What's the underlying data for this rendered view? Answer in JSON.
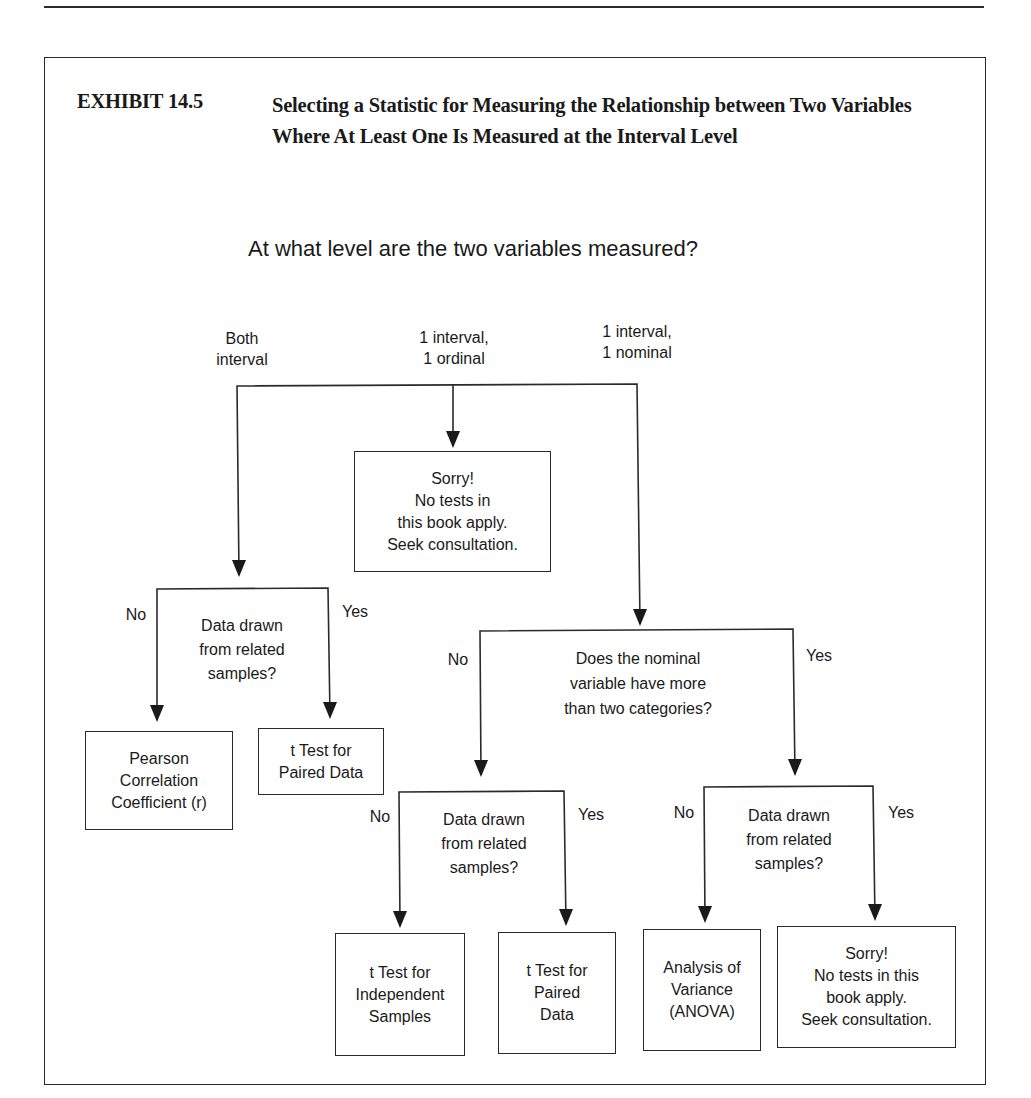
{
  "exhibit": {
    "label": "EXHIBIT 14.5",
    "title": "Selecting a Statistic for Measuring the Relationship between Two Variables Where At Least One Is Measured at the Interval Level"
  },
  "flowchart": {
    "root_question": "At what level are the two variables measured?",
    "level_options": [
      {
        "label": "Both\ninterval"
      },
      {
        "label": "1 interval,\n1 ordinal"
      },
      {
        "label": "1 interval,\n1 nominal"
      }
    ],
    "ordinal_result": "Sorry!\nNo tests in\nthis book apply.\nSeek consultation.",
    "both_interval": {
      "question": "Data drawn\nfrom related\nsamples?",
      "no_label": "No",
      "yes_label": "Yes",
      "no_result": "Pearson\nCorrelation\nCoefficient (r)",
      "yes_result": "t Test for\nPaired Data"
    },
    "nominal": {
      "question": "Does the nominal\nvariable have more\nthan two categories?",
      "no_label": "No",
      "yes_label": "Yes",
      "two_categories": {
        "question": "Data drawn\nfrom related\nsamples?",
        "no_label": "No",
        "yes_label": "Yes",
        "no_result": "t Test for\nIndependent\nSamples",
        "yes_result": "t Test for\nPaired\nData"
      },
      "more_categories": {
        "question": "Data drawn\nfrom related\nsamples?",
        "no_label": "No",
        "yes_label": "Yes",
        "no_result": "Analysis of\nVariance\n(ANOVA)",
        "yes_result": "Sorry!\nNo tests in this\nbook apply.\nSeek consultation."
      }
    }
  },
  "colors": {
    "line": "#2a2a2a",
    "text": "#1a1a1a",
    "background": "#ffffff"
  }
}
